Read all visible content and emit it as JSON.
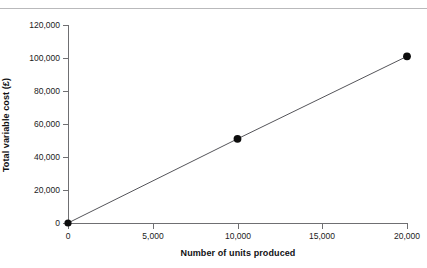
{
  "figure": {
    "caption_clipped": "Figure",
    "top_rule_color": "#b9b9bb",
    "background": "#ffffff"
  },
  "chart_data": {
    "type": "line",
    "title": "",
    "subtitle": "",
    "xlabel": "Number of units produced",
    "ylabel": "Total variable cost (£)",
    "xlim": [
      0,
      20000
    ],
    "ylim": [
      0,
      120000
    ],
    "xticks": [
      0,
      5000,
      10000,
      15000,
      20000
    ],
    "yticks": [
      0,
      20000,
      40000,
      60000,
      80000,
      100000,
      120000
    ],
    "xticklabels": [
      "0",
      "5,000",
      "10,000",
      "15,000",
      "20,000"
    ],
    "yticklabels": [
      "0",
      "20,000",
      "40,000",
      "60,000",
      "80,000",
      "100,000",
      "120,000"
    ],
    "grid": false,
    "legend": false,
    "legend_position": "none",
    "annotations": [],
    "line_color": "#55555a",
    "marker_color": "#0d0d0d",
    "series": [
      {
        "name": "Total variable cost",
        "x": [
          0,
          10000,
          20000
        ],
        "values": [
          0,
          51000,
          101000
        ],
        "marker": "circle",
        "markers_shown": true
      }
    ]
  }
}
